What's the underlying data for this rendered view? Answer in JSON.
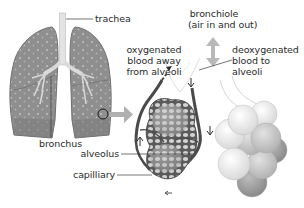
{
  "diagram": {
    "title": "",
    "labels": {
      "trachea": "trachea",
      "bronchus": "bronchus",
      "bronchiole_line1": "bronchiole",
      "bronchiole_line2": "(air in and out)",
      "oxygenated_line1": "oxygenated",
      "oxygenated_line2": "blood away",
      "oxygenated_line3": "from alveoli",
      "deoxygenated_line1": "deoxygenated",
      "deoxygenated_line2": "blood to",
      "deoxygenated_line3": "alveoli",
      "alveolus": "alveolus",
      "capillary": "capilliary"
    },
    "parts": [
      {
        "id": "lungs",
        "name": "lungs"
      },
      {
        "id": "trachea",
        "name": "trachea"
      },
      {
        "id": "bronchus",
        "name": "bronchus"
      },
      {
        "id": "magnified-circle",
        "name": "magnified region marker"
      },
      {
        "id": "zoom-arrow",
        "name": "arrow to magnified view"
      },
      {
        "id": "alveoli-with-capillaries",
        "name": "alveoli wrapped in capillary network"
      },
      {
        "id": "alveoli-cluster",
        "name": "alveoli cluster"
      },
      {
        "id": "air-arrow",
        "name": "double-headed air flow arrow"
      }
    ],
    "colors": {
      "lung_fill": "#8c8c8c",
      "lung_dark": "#6e6e6e",
      "lung_spots": "#bdbdbd",
      "airway": "#d8d8d8",
      "arrow_gray": "#a9a9a9",
      "vessel_dark": "#4a4a4a",
      "alveolus_light": "#e9e9e9",
      "alveolus_mid": "#c4c4c4",
      "alveolus_dark": "#9a9a9a",
      "text": "#2b2b2b",
      "leader_line": "#3a3a3a"
    }
  }
}
